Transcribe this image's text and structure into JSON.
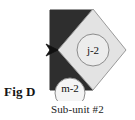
{
  "figure": {
    "label": "Fig D",
    "caption": "Sub-unit #2",
    "nodes": {
      "inner_node_label": "j-2",
      "corner_node_label": "m-2"
    },
    "shapes": {
      "dark_block_name": "dark-square-block",
      "diamond_name": "light-diamond-block",
      "marker_name": "left-vertex-arrow-marker"
    },
    "colors": {
      "dark_fill": "#2e2e2e",
      "light_fill": "#e3e3e3",
      "node_fill": "#ececec",
      "outline": "#8c8c8c",
      "text": "#111111",
      "background": "#ffffff"
    },
    "geometry": {
      "dark_square": "50,10 93,10 93,90 50,90",
      "diamond": "93,9 126,50 93,90 58,50",
      "marker": "47,45 58,50 47,55 50,50",
      "inner_node_cx": 93,
      "inner_node_cy": 50,
      "inner_node_r": 16,
      "corner_node_cx": 70,
      "corner_node_cy": 93,
      "corner_node_r": 15
    }
  }
}
